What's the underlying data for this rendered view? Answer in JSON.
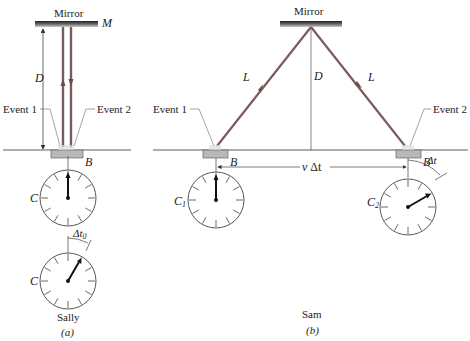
{
  "panel_a": {
    "mirror_label": "Mirror",
    "mirror_symbol": "M",
    "distance_label": "D",
    "event1_label": "Event 1",
    "event2_label": "Event 2",
    "block_label": "B",
    "clock1_label": "C",
    "clock2_label": "C",
    "interval_label": "Δt",
    "interval_subscript": "0",
    "observer_label": "Sally",
    "caption": "(a)"
  },
  "panel_b": {
    "mirror_label": "Mirror",
    "distance_label": "D",
    "path_left_label": "L",
    "path_right_label": "L",
    "event1_label": "Event 1",
    "event2_label": "Event 2",
    "block1_label": "B",
    "block2_label": "B",
    "displacement_label_v": "v",
    "displacement_label_dt": "Δt",
    "clock1_label": "C",
    "clock1_subscript": "1",
    "clock2_label": "C",
    "clock2_subscript": "2",
    "interval_label": "Δt",
    "observer_label": "Sam",
    "caption": "(b)"
  },
  "colors": {
    "beam": "#7a5c5c",
    "line": "#333333",
    "block": "#b8b8b8",
    "mirror_dark": "#2a2a2a"
  }
}
